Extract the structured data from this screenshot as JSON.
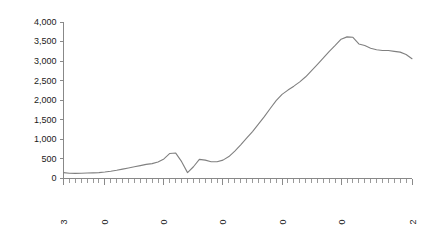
{
  "chart_data": {
    "type": "line",
    "title": "",
    "subtitle": "",
    "xlabel": "",
    "ylabel": "",
    "xlim": [
      1953,
      2012
    ],
    "ylim": [
      0,
      4000
    ],
    "grid": false,
    "legend": "none",
    "line_color": "#808080",
    "axis_color": "#888888",
    "y_ticks": [
      0,
      500,
      1000,
      1500,
      2000,
      2500,
      3000,
      3500,
      4000
    ],
    "y_tick_labels": [
      "0",
      "500",
      "1,000",
      "1,500",
      "2,000",
      "2,500",
      "3,000",
      "3,500",
      "4,000"
    ],
    "x_tick_labels": [
      "1953",
      "1960",
      "1970",
      "1980",
      "1990",
      "2000",
      "2012"
    ],
    "x_tick_label_years": [
      1953,
      1960,
      1970,
      1980,
      1990,
      2000,
      2012
    ],
    "x_minor_tick_interval": 1,
    "x_label_rotation": -90,
    "series": [
      {
        "name": "series-1",
        "x": [
          1953,
          1954,
          1955,
          1956,
          1957,
          1958,
          1959,
          1960,
          1961,
          1962,
          1963,
          1964,
          1965,
          1966,
          1967,
          1968,
          1969,
          1970,
          1971,
          1972,
          1973,
          1974,
          1975,
          1976,
          1977,
          1978,
          1979,
          1980,
          1981,
          1982,
          1983,
          1984,
          1985,
          1986,
          1987,
          1988,
          1989,
          1990,
          1991,
          1992,
          1993,
          1994,
          1995,
          1996,
          1997,
          1998,
          1999,
          2000,
          2001,
          2002,
          2003,
          2004,
          2005,
          2006,
          2007,
          2008,
          2009,
          2010,
          2011,
          2012
        ],
        "values": [
          150,
          135,
          130,
          135,
          140,
          145,
          150,
          165,
          185,
          210,
          240,
          270,
          300,
          330,
          360,
          380,
          420,
          500,
          640,
          650,
          430,
          150,
          300,
          490,
          470,
          430,
          430,
          470,
          560,
          700,
          860,
          1030,
          1200,
          1390,
          1580,
          1790,
          1990,
          2150,
          2260,
          2360,
          2470,
          2600,
          2760,
          2920,
          3080,
          3250,
          3400,
          3560,
          3620,
          3610,
          3440,
          3400,
          3330,
          3290,
          3270,
          3270,
          3250,
          3230,
          3170,
          3060
        ]
      }
    ]
  },
  "axes": {
    "y_axis_name": "value-axis",
    "x_axis_name": "year-axis"
  }
}
